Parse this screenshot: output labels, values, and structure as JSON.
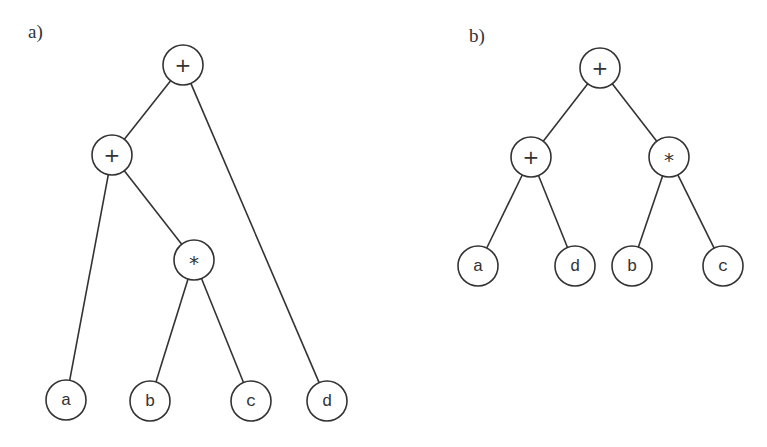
{
  "panels": [
    {
      "label": "a)",
      "label_pos": [
        28,
        38
      ],
      "nodes": [
        {
          "id": "r",
          "text": "+",
          "x": 183,
          "y": 65,
          "op": true
        },
        {
          "id": "p",
          "text": "+",
          "x": 112,
          "y": 155,
          "op": true
        },
        {
          "id": "m",
          "text": "*",
          "x": 194,
          "y": 260,
          "op": true
        },
        {
          "id": "a",
          "text": "a",
          "x": 66,
          "y": 400,
          "op": false
        },
        {
          "id": "b",
          "text": "b",
          "x": 150,
          "y": 401,
          "op": false
        },
        {
          "id": "c",
          "text": "c",
          "x": 251,
          "y": 401,
          "op": false
        },
        {
          "id": "d",
          "text": "d",
          "x": 327,
          "y": 401,
          "op": false
        }
      ],
      "edges": [
        [
          "r",
          "p"
        ],
        [
          "r",
          "d"
        ],
        [
          "p",
          "a"
        ],
        [
          "p",
          "m"
        ],
        [
          "m",
          "b"
        ],
        [
          "m",
          "c"
        ]
      ]
    },
    {
      "label": "b)",
      "label_pos": [
        469,
        42
      ],
      "nodes": [
        {
          "id": "r",
          "text": "+",
          "x": 600,
          "y": 68,
          "op": true
        },
        {
          "id": "p",
          "text": "+",
          "x": 531,
          "y": 157,
          "op": true
        },
        {
          "id": "m",
          "text": "*",
          "x": 669,
          "y": 157,
          "op": true
        },
        {
          "id": "a",
          "text": "a",
          "x": 478,
          "y": 266,
          "op": false
        },
        {
          "id": "d",
          "text": "d",
          "x": 575,
          "y": 266,
          "op": false
        },
        {
          "id": "b",
          "text": "b",
          "x": 632,
          "y": 266,
          "op": false
        },
        {
          "id": "c",
          "text": "c",
          "x": 723,
          "y": 266,
          "op": false
        }
      ],
      "edges": [
        [
          "r",
          "p"
        ],
        [
          "r",
          "m"
        ],
        [
          "p",
          "a"
        ],
        [
          "p",
          "d"
        ],
        [
          "m",
          "b"
        ],
        [
          "m",
          "c"
        ]
      ]
    }
  ],
  "node_radius": 20,
  "colors": {
    "stroke": "#333333",
    "background": "#ffffff"
  }
}
